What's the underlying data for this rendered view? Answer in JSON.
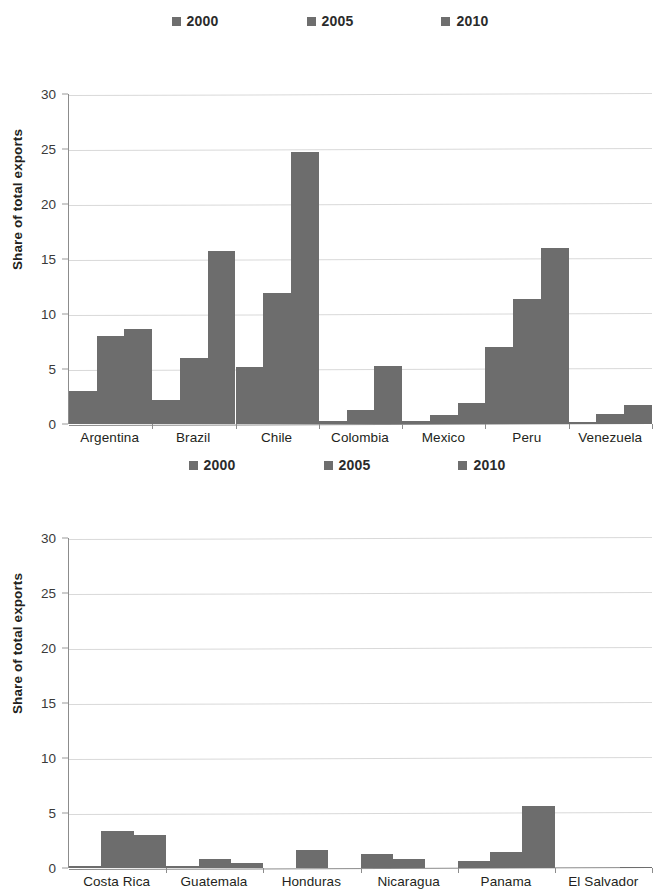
{
  "chart_data": [
    {
      "type": "bar",
      "id": "south-america",
      "title": "",
      "xlabel": "",
      "ylabel": "Share of total exports",
      "ylim": [
        0,
        30
      ],
      "yticks": [
        0,
        5,
        10,
        15,
        20,
        25,
        30
      ],
      "grid": true,
      "legend_position": "top-center",
      "categories": [
        "Argentina",
        "Brazil",
        "Chile",
        "Colombia",
        "Mexico",
        "Peru",
        "Venezuela"
      ],
      "series": [
        {
          "name": "2000",
          "color": "#6d6d6d",
          "values": [
            3.0,
            2.2,
            5.2,
            0.3,
            0.3,
            7.0,
            0.2
          ]
        },
        {
          "name": "2005",
          "color": "#6d6d6d",
          "values": [
            8.0,
            6.0,
            11.9,
            1.3,
            0.8,
            11.4,
            0.9
          ]
        },
        {
          "name": "2010",
          "color": "#6d6d6d",
          "values": [
            8.6,
            15.7,
            24.7,
            5.3,
            1.9,
            16.0,
            1.7
          ]
        }
      ]
    },
    {
      "type": "bar",
      "id": "central-america",
      "title": "",
      "xlabel": "",
      "ylabel": "Share of total exports",
      "ylim": [
        0,
        30
      ],
      "yticks": [
        0,
        5,
        10,
        15,
        20,
        25,
        30
      ],
      "grid": true,
      "legend_position": "top-center",
      "categories": [
        "Costa Rica",
        "Guatemala",
        "Honduras",
        "Nicaragua",
        "Panama",
        "El Salvador"
      ],
      "series": [
        {
          "name": "2000",
          "color": "#6d6d6d",
          "values": [
            0.15,
            0.15,
            0.0,
            1.3,
            0.6,
            0.0
          ]
        },
        {
          "name": "2005",
          "color": "#6d6d6d",
          "values": [
            3.4,
            0.8,
            1.6,
            0.8,
            1.5,
            0.0
          ]
        },
        {
          "name": "2010",
          "color": "#6d6d6d",
          "values": [
            3.0,
            0.5,
            0.0,
            0.0,
            5.6,
            0.05
          ]
        }
      ]
    }
  ]
}
